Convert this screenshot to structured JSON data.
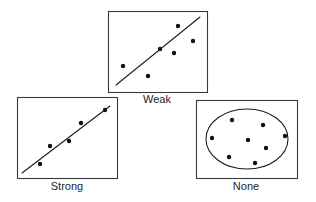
{
  "figure": {
    "width": 316,
    "height": 202,
    "background_color": "#ffffff",
    "frame_color": "#3a3a3a",
    "ink_color": "#111111"
  },
  "chart_data": {
    "type": "scatter",
    "title": "",
    "xlabel": "",
    "ylabel": "",
    "grid": false,
    "legend": "none",
    "axis_ticks": false,
    "panels": [
      {
        "id": "weak",
        "caption": "Weak",
        "caption_x": 157,
        "caption_y": 103,
        "frame": {
          "x": 108,
          "y": 11,
          "width": 99,
          "height": 81
        },
        "overlay": {
          "kind": "line",
          "x1": 116,
          "y1": 85,
          "x2": 200,
          "y2": 17
        },
        "points": [
          {
            "x": 178,
            "y": 26
          },
          {
            "x": 193,
            "y": 41
          },
          {
            "x": 160,
            "y": 49
          },
          {
            "x": 174,
            "y": 53
          },
          {
            "x": 123,
            "y": 66
          },
          {
            "x": 148,
            "y": 76
          }
        ]
      },
      {
        "id": "strong",
        "caption": "Strong",
        "caption_x": 67,
        "caption_y": 190,
        "frame": {
          "x": 17,
          "y": 97,
          "width": 100,
          "height": 81
        },
        "overlay": {
          "kind": "line",
          "x1": 22,
          "y1": 173,
          "x2": 110,
          "y2": 106
        },
        "points": [
          {
            "x": 105,
            "y": 110
          },
          {
            "x": 81,
            "y": 123
          },
          {
            "x": 69,
            "y": 141
          },
          {
            "x": 50,
            "y": 146
          },
          {
            "x": 40,
            "y": 164
          }
        ]
      },
      {
        "id": "none",
        "caption": "None",
        "caption_x": 246,
        "caption_y": 190,
        "frame": {
          "x": 196,
          "y": 100,
          "width": 101,
          "height": 78
        },
        "overlay": {
          "kind": "ellipse",
          "cx": 247,
          "cy": 139,
          "rx": 41,
          "ry": 30
        },
        "points": [
          {
            "x": 232,
            "y": 120
          },
          {
            "x": 263,
            "y": 125
          },
          {
            "x": 285,
            "y": 136
          },
          {
            "x": 212,
            "y": 138
          },
          {
            "x": 248,
            "y": 140
          },
          {
            "x": 266,
            "y": 148
          },
          {
            "x": 229,
            "y": 157
          },
          {
            "x": 255,
            "y": 163
          }
        ]
      }
    ],
    "point_radius": 2.2
  }
}
